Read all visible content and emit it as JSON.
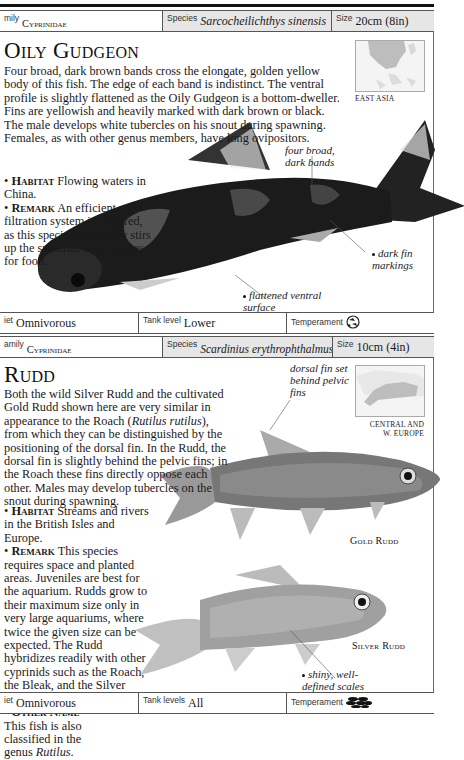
{
  "oily_gudgeon": {
    "header": {
      "family_label": "Family",
      "family_visible": "mily",
      "family_value": "Cyprinidae",
      "species_label": "Species",
      "species_value": "Sarcocheilichthys sinensis",
      "size_label": "Size",
      "size_value": "20cm (8in)"
    },
    "title": "Oily Gudgeon",
    "description": "Four broad, dark brown bands cross the elongate, golden yellow body of this fish. The edge of each band is indistinct. The ventral profile is slightly flattened as the Oily Gudgeon is a bottom-dweller. Fins are yellowish and heavily marked with dark brown or black. The male develops white tubercles on his snout during spawning. Females, as with other genus members, have long ovipositors.",
    "habitat_label": "Habitat",
    "habitat_text": "Flowing waters in China.",
    "remark_label": "Remark",
    "remark_text": "An efficient filtration system is required, as this species constantly stirs up the substrate as it forages for food.",
    "map_label": "EAST ASIA",
    "callouts": {
      "bands": "four broad, dark bands",
      "fins": "dark fin markings",
      "ventral": "flattened ventral surface"
    },
    "footer": {
      "diet_label": "iet",
      "diet_value": "Omnivorous",
      "tank_label": "Tank level",
      "tank_value": "Lower",
      "temperament_label": "Temperament",
      "temperament_icon": "semi-aggressive-fish-icon"
    }
  },
  "rudd": {
    "header": {
      "family_visible": "amily",
      "family_value": "Cyprinidae",
      "species_label": "Species",
      "species_value": "Scardinius erythrophthalmus",
      "size_label": "Size",
      "size_value": "10cm (4in)"
    },
    "title": "Rudd",
    "description_1": "Both the wild Silver Rudd and the cultivated Gold Rudd shown here are very similar in appearance to the Roach (",
    "description_italic": "Rutilus rutilus",
    "description_2": "), from which they can be distinguished by the positioning of the dorsal fin. In the Rudd, the dorsal fin is slightly behind the pelvic fins; in the Roach these fins directly oppose each other. Males may develop tubercles on the snout during spawning.",
    "habitat_label": "Habitat",
    "habitat_text": "Streams and rivers in the British Isles and Europe.",
    "remark_label": "Remark",
    "remark_text": "This species requires space and planted areas. Juveniles are best for the aquarium. Rudds grow to their maximum size only in very large aquariums, where twice the given size can be expected. The Rudd hybridizes readily with other cyprinids such as the Roach, the Bleak, and the Silver Bream.",
    "other_name_label": "Other Name",
    "other_name_text": "This fish is also classified in the genus ",
    "other_name_italic": "Rutilus",
    "other_name_end": ".",
    "map_label_1": "CENTRAL AND",
    "map_label_2": "W. EUROPE",
    "callouts": {
      "dorsal": "dorsal fin set behind pelvic fins",
      "scales": "shiny, well-defined scales"
    },
    "captions": {
      "gold": "Gold Rudd",
      "silver": "Silver Rudd"
    },
    "footer": {
      "diet_label": "iet",
      "diet_value": "Omnivorous",
      "tank_label": "Tank levels",
      "tank_value": "All",
      "temperament_label": "Temperament",
      "temperament_icon": "peaceful-shoal-fish-icon"
    }
  }
}
